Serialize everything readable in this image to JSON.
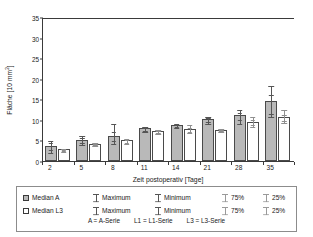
{
  "chart_data": {
    "type": "bar",
    "title": "",
    "xlabel": "Zeit postoperativ [Tage]",
    "ylabel": "Fläche [10 mm²]",
    "ylabel_base": "Fläche [10 mm",
    "ylabel_sup": "2",
    "ylabel_tail": "]",
    "categories": [
      "2",
      "5",
      "8",
      "11",
      "14",
      "21",
      "28",
      "35"
    ],
    "ylim": [
      0,
      35
    ],
    "yticks": [
      0,
      5,
      10,
      15,
      20,
      25,
      30,
      35
    ],
    "grid": false,
    "legend_position": "below-axis",
    "series": [
      {
        "name": "Median A",
        "key": "A",
        "color": "#b9b9b9",
        "values": [
          3.7,
          5.2,
          6.0,
          8.0,
          8.8,
          10.3,
          11.2,
          14.6
        ],
        "maximum": [
          5.1,
          6.3,
          9.3,
          8.6,
          9.3,
          10.9,
          12.6,
          18.5
        ],
        "minimum": [
          2.3,
          4.1,
          4.3,
          7.3,
          8.2,
          9.3,
          9.3,
          11.0
        ],
        "p75": [
          4.5,
          5.8,
          7.2,
          8.3,
          9.1,
          10.6,
          12.0,
          16.3
        ],
        "p25": [
          3.0,
          4.7,
          5.0,
          7.6,
          8.5,
          9.8,
          10.3,
          11.6
        ]
      },
      {
        "name": "Median L3",
        "key": "L3",
        "color": "#ffffff",
        "values": [
          2.8,
          4.2,
          5.0,
          7.3,
          7.9,
          7.6,
          9.6,
          10.6
        ],
        "maximum": [
          3.1,
          4.5,
          5.6,
          7.7,
          8.9,
          7.9,
          11.0,
          12.6
        ],
        "minimum": [
          2.5,
          4.0,
          4.4,
          6.7,
          7.0,
          7.3,
          8.6,
          9.5
        ],
        "p75": [
          2.9,
          4.3,
          5.3,
          7.5,
          8.3,
          7.8,
          10.3,
          11.4
        ],
        "p25": [
          2.7,
          4.1,
          4.7,
          7.0,
          7.4,
          7.5,
          9.1,
          10.0
        ]
      }
    ]
  },
  "legend": {
    "rows": [
      {
        "swatch": "filled-square",
        "median_label": "Median A",
        "maximum_label": "Maximum",
        "minimum_label": "Minimum",
        "p75_label": "75%",
        "p25_label": "25%"
      },
      {
        "swatch": "open-square",
        "median_label": "Median L3",
        "maximum_label": "Maximum",
        "minimum_label": "Minimum",
        "p75_label": "75%",
        "p25_label": "25%"
      }
    ],
    "note": [
      "A = A-Serie",
      "L1 = L1-Serie",
      "L3 = L3-Serie"
    ]
  }
}
